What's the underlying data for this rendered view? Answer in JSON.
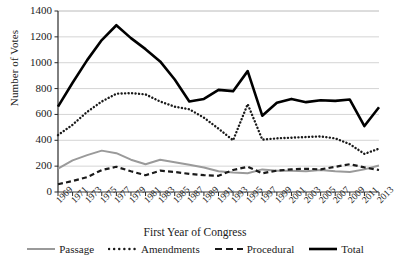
{
  "chart_data": {
    "type": "line",
    "title": "",
    "xlabel": "First Year of Congress",
    "ylabel": "Number of Votes",
    "ylim": [
      0,
      1400
    ],
    "yticks": [
      0,
      200,
      400,
      600,
      800,
      1000,
      1200,
      1400
    ],
    "grid": true,
    "legend_position": "bottom",
    "x": [
      1969,
      1971,
      1973,
      1975,
      1977,
      1979,
      1981,
      1983,
      1985,
      1987,
      1989,
      1991,
      1993,
      1995,
      1997,
      1999,
      2001,
      2003,
      2005,
      2007,
      2009,
      2011,
      2013
    ],
    "categories": [
      "1969",
      "1971",
      "1973",
      "1975",
      "1977",
      "1979",
      "1981",
      "1983",
      "1985",
      "1987",
      "1989",
      "1991",
      "1993",
      "1995",
      "1997",
      "1999",
      "2001",
      "2003",
      "2005",
      "2007",
      "2009",
      "2011",
      "2013"
    ],
    "series": [
      {
        "name": "Passage",
        "color": "#9a9a9a",
        "style": "solid",
        "values": [
          180,
          245,
          285,
          320,
          300,
          250,
          215,
          250,
          230,
          210,
          190,
          160,
          150,
          145,
          175,
          165,
          165,
          160,
          170,
          160,
          155,
          175,
          205
        ]
      },
      {
        "name": "Amendments",
        "color": "#1a1a1a",
        "style": "dotted",
        "values": [
          440,
          520,
          620,
          700,
          760,
          765,
          755,
          700,
          660,
          640,
          575,
          490,
          400,
          680,
          405,
          415,
          420,
          425,
          430,
          415,
          370,
          295,
          335
        ]
      },
      {
        "name": "Procedural",
        "color": "#1a1a1a",
        "style": "dashed",
        "values": [
          60,
          85,
          115,
          170,
          195,
          160,
          130,
          165,
          155,
          140,
          130,
          125,
          170,
          195,
          145,
          165,
          175,
          180,
          175,
          195,
          215,
          190,
          170
        ]
      },
      {
        "name": "Total",
        "color": "#000000",
        "style": "thick-solid",
        "values": [
          660,
          845,
          1020,
          1175,
          1290,
          1190,
          1105,
          1010,
          870,
          700,
          720,
          790,
          780,
          935,
          590,
          690,
          720,
          695,
          710,
          705,
          715,
          510,
          655
        ]
      }
    ]
  },
  "axes": {
    "y_title": "Number of Votes",
    "x_title": "First Year of Congress"
  },
  "legend": {
    "items": [
      {
        "label": "Passage",
        "key": "passage"
      },
      {
        "label": "Amendments",
        "key": "amendments"
      },
      {
        "label": "Procedural",
        "key": "procedural"
      },
      {
        "label": "Total",
        "key": "total"
      }
    ]
  }
}
